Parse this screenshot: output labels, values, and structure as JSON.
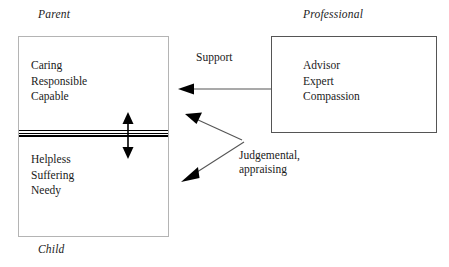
{
  "diagram": {
    "title_labels": {
      "parent": "Parent",
      "professional": "Professional",
      "child": "Child"
    },
    "boxes": [
      {
        "id": "parent-child",
        "upper_role": "Parent",
        "lower_role": "Child",
        "upper_traits": "Caring\nResponsible\nCapable",
        "lower_traits": "Helpless\nSuffering\nNeedy",
        "border_color": "#b4b4b4",
        "divider_style": "triple-rule"
      },
      {
        "id": "professional",
        "role": "Professional",
        "traits": "Advisor\nExpert\nCompassion",
        "border_color": "#555555"
      }
    ],
    "connectors": [
      {
        "id": "support-arrow",
        "label": "Support",
        "direction": "right-to-left",
        "head": "single",
        "target": "parent-section"
      },
      {
        "id": "judgemental-arrow-upper",
        "label": "Judgemental,\nappraising",
        "direction": "right-to-left",
        "head": "single",
        "target": "parent-section"
      },
      {
        "id": "judgemental-arrow-lower",
        "label": "",
        "direction": "right-to-left",
        "head": "single",
        "target": "child-section"
      },
      {
        "id": "parent-child-vertical-arrow",
        "label": "",
        "direction": "bidirectional",
        "head": "double",
        "target": "parent-child-divider"
      }
    ],
    "edge_labels": {
      "support": "Support",
      "judgemental": "Judgemental,\nappraising"
    },
    "colors": {
      "text": "#1a1a1a",
      "line": "#555555",
      "arrow": "#000000",
      "background": "#ffffff",
      "box_light_border": "#b4b4b4",
      "box_dark_border": "#555555"
    }
  }
}
